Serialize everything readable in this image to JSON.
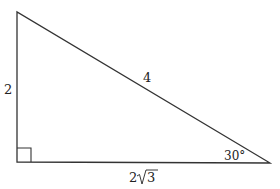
{
  "diagram": {
    "type": "right-triangle",
    "stroke_color": "#333333",
    "vertices": {
      "top": [
        17,
        12
      ],
      "right_angle": [
        17,
        162
      ],
      "bottom_right": [
        270,
        163
      ]
    },
    "right_angle_marker_size": 14,
    "labels": {
      "left_side": "2",
      "hypotenuse": "4",
      "base_coef": "2",
      "base_radicand": "3",
      "angle": "30°"
    }
  }
}
